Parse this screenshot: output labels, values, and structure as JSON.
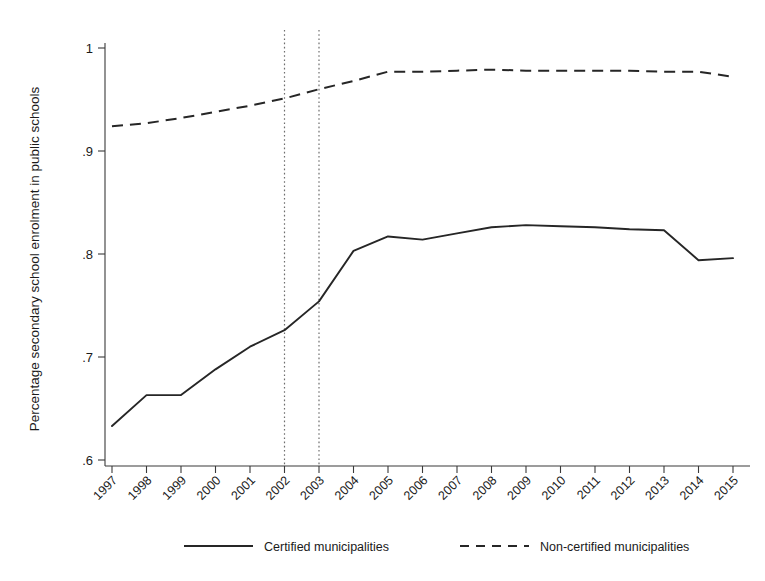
{
  "chart_data": {
    "type": "line",
    "title": "",
    "subtitle": "",
    "xlabel": "",
    "ylabel": "Percentage secondary school enrolment in public schools",
    "x": [
      1997,
      1998,
      1999,
      2000,
      2001,
      2002,
      2003,
      2004,
      2005,
      2006,
      2007,
      2008,
      2009,
      2010,
      2011,
      2012,
      2013,
      2014,
      2015
    ],
    "categories": [
      "1997",
      "1998",
      "1999",
      "2000",
      "2001",
      "2002",
      "2003",
      "2004",
      "2005",
      "2006",
      "2007",
      "2008",
      "2009",
      "2010",
      "2011",
      "2012",
      "2013",
      "2014",
      "2015"
    ],
    "series": [
      {
        "name": "Certified municipalities",
        "style": "solid",
        "color": "#262626",
        "values": [
          0.633,
          0.663,
          0.663,
          0.688,
          0.71,
          0.726,
          0.754,
          0.803,
          0.817,
          0.814,
          0.82,
          0.826,
          0.828,
          0.827,
          0.826,
          0.824,
          0.823,
          0.794,
          0.796
        ]
      },
      {
        "name": "Non-certified municipalities",
        "style": "dashed",
        "color": "#262626",
        "values": [
          0.924,
          0.927,
          0.932,
          0.938,
          0.944,
          0.951,
          0.96,
          0.968,
          0.977,
          0.977,
          0.978,
          0.979,
          0.978,
          0.978,
          0.978,
          0.978,
          0.977,
          0.977,
          0.972
        ]
      }
    ],
    "ylim": [
      0.6,
      1.0
    ],
    "yticks": [
      0.6,
      0.7,
      0.8,
      0.9,
      1.0
    ],
    "ytick_labels": [
      ".6",
      ".7",
      ".8",
      ".9",
      "1"
    ],
    "xlim": [
      1997,
      2015
    ],
    "grid": false,
    "legend_position": "bottom",
    "annotations": [
      {
        "type": "vertical-line",
        "x": 2002,
        "style": "dotted"
      },
      {
        "type": "vertical-line",
        "x": 2003,
        "style": "dotted"
      }
    ]
  },
  "legend": {
    "entries": [
      {
        "label": "Certified municipalities",
        "style": "solid"
      },
      {
        "label": "Non-certified municipalities",
        "style": "dashed"
      }
    ]
  }
}
